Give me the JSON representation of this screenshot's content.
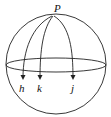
{
  "diagram": {
    "pole_label": "P",
    "meridian_labels": [
      "h",
      "k",
      "j"
    ],
    "stroke_color": "#222222"
  }
}
